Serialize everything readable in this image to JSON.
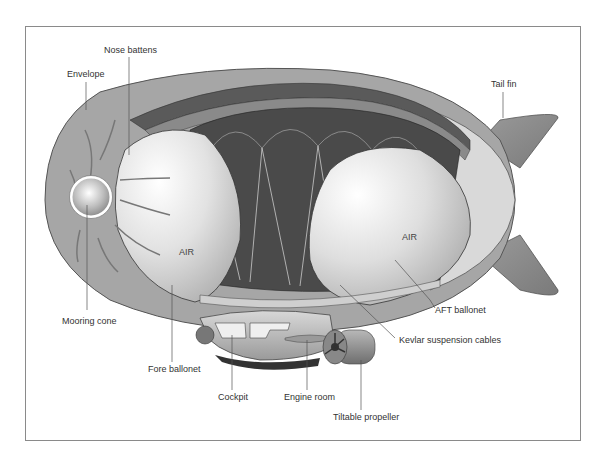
{
  "diagram": {
    "labels": {
      "nose_battens": "Nose battens",
      "envelope": "Envelope",
      "tail_fin": "Tail fin",
      "mooring_cone": "Mooring cone",
      "fore_ballonet": "Fore ballonet",
      "cockpit": "Cockpit",
      "engine_room": "Engine room",
      "tiltable_propeller": "Tiltable propeller",
      "aft_ballonet": "AFT ballonet",
      "kevlar_cables": "Kevlar suspension cables"
    },
    "ballonet_text": {
      "fore": "AIR",
      "aft": "AIR"
    },
    "colors": {
      "envelope": "#a6a6a6",
      "gas_cell_dark": "#4a4a4a",
      "ballonet_light": "#e4e4e4",
      "frame": "#8a8a8a",
      "label_text": "#333333"
    }
  }
}
